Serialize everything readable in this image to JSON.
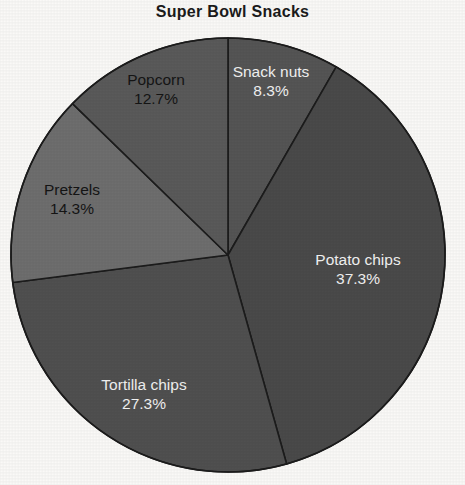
{
  "chart_data": {
    "type": "pie",
    "title": "Super Bowl Snacks",
    "categories": [
      "Snack nuts",
      "Potato chips",
      "Tortilla chips",
      "Pretzels",
      "Popcorn"
    ],
    "values": [
      8.3,
      37.3,
      27.3,
      14.3,
      12.7
    ],
    "value_unit": "%",
    "start_angle_deg": 90,
    "direction": "clockwise",
    "legend": "none",
    "grid": false,
    "slices": [
      {
        "label": "Snack nuts",
        "percent_label": "8.3%",
        "value": 8.3,
        "color": "#555555",
        "text_color": "#f2f2f2"
      },
      {
        "label": "Potato chips",
        "percent_label": "37.3%",
        "value": 37.3,
        "color": "#4a4a4a",
        "text_color": "#f2f2f2"
      },
      {
        "label": "Tortilla chips",
        "percent_label": "27.3%",
        "value": 27.3,
        "color": "#505050",
        "text_color": "#f2f2f2"
      },
      {
        "label": "Pretzels",
        "percent_label": "14.3%",
        "value": 14.3,
        "color": "#6e6e6e",
        "text_color": "#151515"
      },
      {
        "label": "Popcorn",
        "percent_label": "12.7%",
        "value": 12.7,
        "color": "#5a5a5a",
        "text_color": "#151515"
      }
    ],
    "xlabel": "",
    "ylabel": ""
  },
  "style": {
    "background": "#faf9f7",
    "slice_border_color": "#1c1c1c",
    "slice_border_width": 1.6,
    "center_x": 228,
    "center_y": 255,
    "radius": 217
  }
}
